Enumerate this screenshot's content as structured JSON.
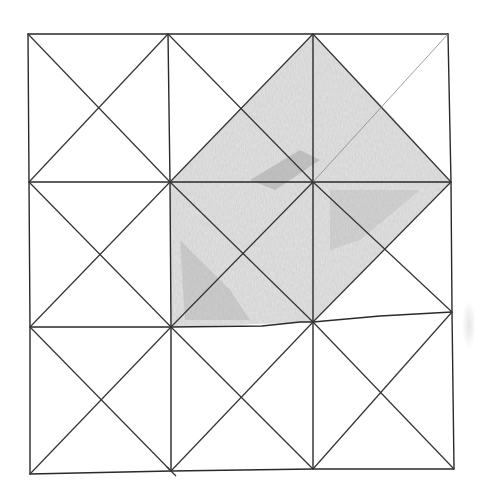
{
  "figure": {
    "type": "hand-drawn pencil sketch",
    "grid": {
      "rows": 3,
      "cols": 3,
      "cell_diagonals": "both"
    },
    "colors": {
      "paper": "#ffffff",
      "line": "#2a2a2a",
      "shade": "#9a9a9a",
      "shade_dark": "#6e6e6e"
    },
    "points": {
      "grid": [
        [
          [
            28,
            34
          ],
          [
            168,
            34
          ],
          [
            313,
            34
          ],
          [
            448,
            34
          ]
        ],
        [
          [
            29,
            182
          ],
          [
            170,
            182
          ],
          [
            313,
            182
          ],
          [
            451,
            182
          ]
        ],
        [
          [
            30,
            327
          ],
          [
            171,
            327
          ],
          [
            313,
            322
          ],
          [
            452,
            312
          ]
        ],
        [
          [
            30,
            474
          ],
          [
            171,
            471
          ],
          [
            313,
            469
          ],
          [
            454,
            469
          ]
        ]
      ]
    },
    "shaded_region": [
      [
        313,
        34
      ],
      [
        384,
        108
      ],
      [
        451,
        182
      ],
      [
        313,
        322
      ],
      [
        171,
        327
      ],
      [
        170,
        182
      ],
      [
        241,
        108
      ]
    ]
  }
}
